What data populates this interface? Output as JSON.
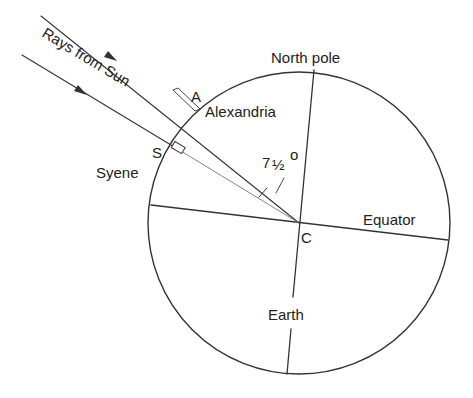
{
  "diagram": {
    "labels": {
      "rays": "Rays from Sun",
      "point_a": "A",
      "alexandria": "Alexandria",
      "point_s": "S",
      "syene": "Syene",
      "north_pole": "North pole",
      "angle_main": "7",
      "angle_frac": "½",
      "angle_deg": "o",
      "equator": "Equator",
      "center": "C",
      "earth": "Earth"
    },
    "angle_value": "7½°",
    "colors": {
      "line": "#333333",
      "text": "#222222",
      "background": "#ffffff"
    }
  }
}
